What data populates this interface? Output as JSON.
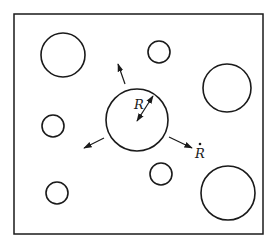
{
  "diagram": {
    "frame": {
      "x": 14,
      "y": 14,
      "width": 249,
      "height": 220
    },
    "stroke_color": "#1a1a1a",
    "background": "#ffffff",
    "bubbles": [
      {
        "id": "top-left-large",
        "cx": 63,
        "cy": 55,
        "r": 22
      },
      {
        "id": "top-middle-small",
        "cx": 159,
        "cy": 52,
        "r": 11
      },
      {
        "id": "right-large",
        "cx": 227,
        "cy": 88,
        "r": 24
      },
      {
        "id": "left-small",
        "cx": 53,
        "cy": 126,
        "r": 11
      },
      {
        "id": "center-main",
        "cx": 137,
        "cy": 120,
        "r": 31
      },
      {
        "id": "bottom-middle-small",
        "cx": 161,
        "cy": 174,
        "r": 11
      },
      {
        "id": "bottom-left-small",
        "cx": 57,
        "cy": 193,
        "r": 11
      },
      {
        "id": "bottom-right-large",
        "cx": 228,
        "cy": 193,
        "r": 27
      }
    ],
    "growth_arrows": [
      {
        "id": "up",
        "x1": 125,
        "y1": 84,
        "x2": 118,
        "y2": 64
      },
      {
        "id": "down-left",
        "x1": 104,
        "y1": 138,
        "x2": 84,
        "y2": 148
      },
      {
        "id": "down-right",
        "x1": 169,
        "y1": 137,
        "x2": 192,
        "y2": 148
      }
    ],
    "radius_arrow": {
      "x1": 137,
      "y1": 121,
      "x2": 153,
      "y2": 96
    },
    "labels": {
      "radius": "R",
      "growth_rate": "R",
      "growth_rate_dot": "•"
    }
  }
}
